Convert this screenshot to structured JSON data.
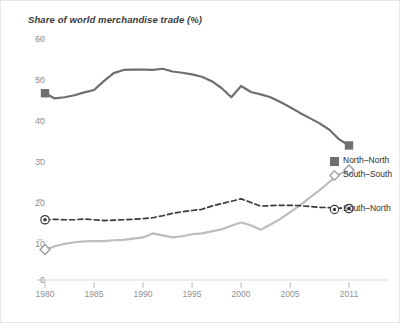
{
  "chart_data": {
    "type": "line",
    "title": "Share of world merchandise trade (%)",
    "xlabel": "",
    "ylabel": "",
    "xlim": [
      1980,
      2011
    ],
    "ylim": [
      0,
      60
    ],
    "yticks": [
      0,
      10,
      20,
      30,
      40,
      50,
      60
    ],
    "xticks": [
      1980,
      1985,
      1990,
      1995,
      2000,
      2005,
      2011
    ],
    "xtick_labels": [
      "1980",
      "1985",
      "1990",
      "1995",
      "2000",
      "2005",
      "2011"
    ],
    "ytick_labels": [
      "0",
      "10",
      "20",
      "30",
      "40",
      "50",
      "60"
    ],
    "grid": false,
    "legend_position": "right",
    "x": [
      1980,
      1981,
      1982,
      1983,
      1984,
      1985,
      1986,
      1987,
      1988,
      1989,
      1990,
      1991,
      1992,
      1993,
      1994,
      1995,
      1996,
      1997,
      1998,
      1999,
      2000,
      2001,
      2002,
      2003,
      2004,
      2005,
      2006,
      2007,
      2008,
      2009,
      2010,
      2011
    ],
    "series": [
      {
        "name": "North–North",
        "style": "solid",
        "color": "#6f6f6f",
        "marker": "square",
        "values": [
          46.5,
          45.2,
          45.5,
          46.0,
          46.7,
          47.3,
          49.5,
          51.5,
          52.3,
          52.4,
          52.4,
          52.3,
          52.6,
          51.9,
          51.6,
          51.2,
          50.6,
          49.5,
          47.8,
          45.5,
          48.3,
          46.8,
          46.2,
          45.5,
          44.3,
          43.0,
          41.6,
          40.3,
          39.0,
          37.4,
          35.0,
          33.5
        ]
      },
      {
        "name": "South–South",
        "style": "solid",
        "color": "#bdbdbd",
        "marker": "diamond",
        "values": [
          7.6,
          8.4,
          9.0,
          9.4,
          9.6,
          9.7,
          9.7,
          9.9,
          10.0,
          10.3,
          10.6,
          11.6,
          11.1,
          10.6,
          10.9,
          11.4,
          11.6,
          12.1,
          12.6,
          13.5,
          14.3,
          13.6,
          12.5,
          13.8,
          15.2,
          16.9,
          18.6,
          20.5,
          22.4,
          24.4,
          26.3,
          27.4
        ]
      },
      {
        "name": "South–North",
        "style": "dashed",
        "color": "#3a3a3a",
        "marker": "target",
        "values": [
          15.0,
          15.1,
          15.0,
          15.0,
          15.2,
          15.0,
          14.8,
          14.9,
          15.0,
          15.1,
          15.3,
          15.5,
          16.0,
          16.6,
          17.0,
          17.3,
          17.6,
          18.4,
          19.0,
          19.6,
          20.2,
          19.3,
          18.4,
          18.5,
          18.6,
          18.6,
          18.5,
          18.3,
          18.1,
          18.0,
          17.9,
          17.8
        ]
      }
    ]
  },
  "legend": {
    "items": [
      {
        "label": "North–North",
        "marker": "square"
      },
      {
        "label": "South–South",
        "marker": "diamond"
      },
      {
        "label": "South–North",
        "marker": "target"
      }
    ]
  }
}
